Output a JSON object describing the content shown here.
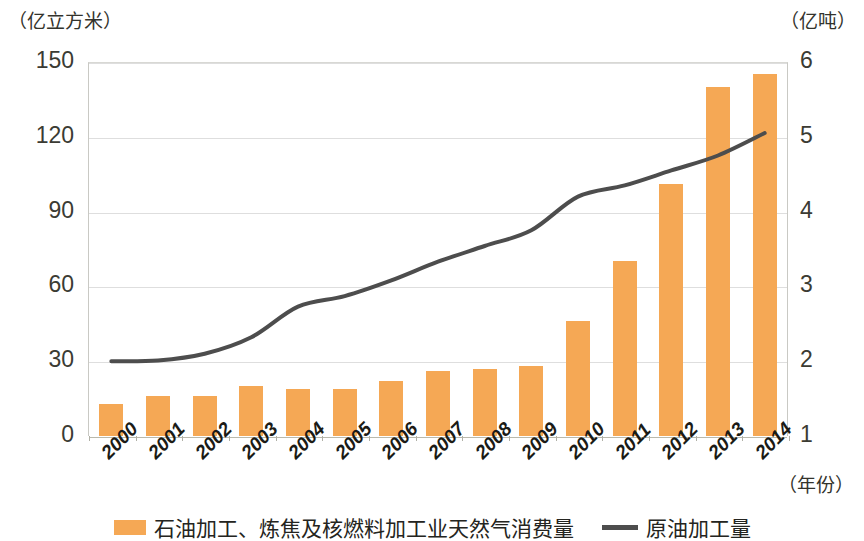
{
  "chart_data": {
    "type": "bar",
    "title": "",
    "subtitle": "",
    "xlabel": "（年份）",
    "ylabel_left": "（亿立方米）",
    "ylabel_right": "（亿吨）",
    "categories": [
      "2000",
      "2001",
      "2002",
      "2003",
      "2004",
      "2005",
      "2006",
      "2007",
      "2008",
      "2009",
      "2010",
      "2011",
      "2012",
      "2013",
      "2014"
    ],
    "ylim_left": [
      0,
      150
    ],
    "ylim_right": [
      1,
      6
    ],
    "yticks_left": [
      0,
      30,
      60,
      90,
      120,
      150
    ],
    "yticks_right": [
      1,
      2,
      3,
      4,
      5,
      6
    ],
    "grid": true,
    "legend_position": "bottom",
    "series": [
      {
        "name": "石油加工、炼焦及核燃料加工业天然气消费量",
        "kind": "bar",
        "axis": "left",
        "unit": "亿立方米",
        "color": "#f5a855",
        "values": [
          13,
          16,
          16,
          20,
          19,
          19,
          22,
          26,
          27,
          28,
          46,
          70,
          101,
          140,
          145
        ]
      },
      {
        "name": "原油加工量",
        "kind": "line",
        "axis": "right",
        "unit": "亿吨",
        "color": "#4d4d4d",
        "values": [
          2.0,
          2.01,
          2.1,
          2.32,
          2.73,
          2.87,
          3.08,
          3.33,
          3.54,
          3.75,
          4.2,
          4.35,
          4.55,
          4.75,
          5.05
        ]
      }
    ]
  },
  "axis_labels": {
    "left_unit": "（亿立方米）",
    "right_unit": "（亿吨）",
    "x_title": "（年份）"
  },
  "legend": {
    "items": [
      {
        "label": "石油加工、炼焦及核燃料加工业天然气消费量",
        "marker": "bar-swatch",
        "color": "#f5a855"
      },
      {
        "label": "原油加工量",
        "marker": "line-swatch",
        "color": "#4d4d4d"
      }
    ]
  }
}
